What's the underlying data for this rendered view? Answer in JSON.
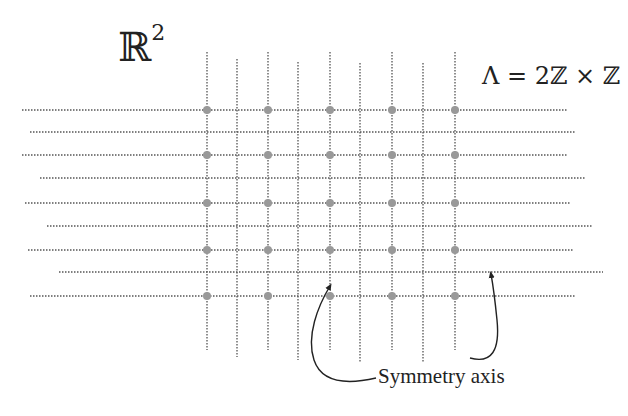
{
  "title": {
    "space_label": "ℝ",
    "space_exponent": "2",
    "lattice_label": "Λ = 2ℤ × ℤ"
  },
  "annotation": {
    "text": "Symmetry axis"
  },
  "colors": {
    "grid_line": "#555555",
    "lattice_point": "#999999",
    "arrow": "#222222",
    "text": "#222222"
  },
  "grid": {
    "vertical_lines": [
      {
        "x": 207,
        "y1": 52,
        "y2": 350
      },
      {
        "x": 237,
        "y1": 59,
        "y2": 357
      },
      {
        "x": 268,
        "y1": 52,
        "y2": 350
      },
      {
        "x": 298,
        "y1": 62,
        "y2": 360
      },
      {
        "x": 330,
        "y1": 52,
        "y2": 350
      },
      {
        "x": 360,
        "y1": 63,
        "y2": 362
      },
      {
        "x": 392,
        "y1": 52,
        "y2": 350
      },
      {
        "x": 423,
        "y1": 63,
        "y2": 362
      },
      {
        "x": 455,
        "y1": 52,
        "y2": 350
      }
    ],
    "horizontal_lines": [
      {
        "y": 110,
        "x1": 22,
        "x2": 568
      },
      {
        "y": 132,
        "x1": 30,
        "x2": 575
      },
      {
        "y": 155,
        "x1": 22,
        "x2": 568
      },
      {
        "y": 178,
        "x1": 40,
        "x2": 585
      },
      {
        "y": 203,
        "x1": 25,
        "x2": 570
      },
      {
        "y": 226,
        "x1": 47,
        "x2": 592
      },
      {
        "y": 250,
        "x1": 28,
        "x2": 573
      },
      {
        "y": 272,
        "x1": 59,
        "x2": 603
      },
      {
        "y": 296,
        "x1": 30,
        "x2": 575
      }
    ],
    "lattice_points": {
      "xs": [
        207,
        268,
        330,
        392,
        455
      ],
      "ys": [
        110,
        155,
        203,
        250,
        296
      ]
    }
  },
  "arrows": [
    {
      "name": "left-arrow",
      "path": "M376,378 C350,384 322,384 314,360 C306,336 318,306 330,286",
      "tip": [
        330,
        284
      ]
    },
    {
      "name": "right-arrow",
      "path": "M470,358 C492,364 500,350 497,320 C495,300 493,285 491,274",
      "tip": [
        491,
        272
      ]
    }
  ]
}
